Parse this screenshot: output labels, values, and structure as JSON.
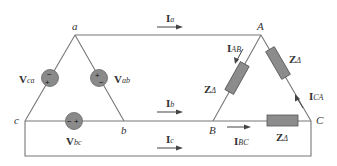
{
  "diagram": {
    "source_nodes": {
      "a": "a",
      "b": "b",
      "c": "c"
    },
    "load_nodes": {
      "A": "A",
      "B": "B",
      "C": "C"
    },
    "sources": [
      {
        "name": "V",
        "sub": "ca",
        "polarity_top": "−",
        "polarity_bottom": "+"
      },
      {
        "name": "V",
        "sub": "ab",
        "polarity_top": "+",
        "polarity_bottom": "−"
      },
      {
        "name": "V",
        "sub": "bc",
        "polarity_left": "−",
        "polarity_right": "+"
      }
    ],
    "line_currents": [
      {
        "name": "I",
        "sub": "a"
      },
      {
        "name": "I",
        "sub": "b"
      },
      {
        "name": "I",
        "sub": "c"
      }
    ],
    "phase_currents": [
      {
        "name": "I",
        "sub": "AB"
      },
      {
        "name": "I",
        "sub": "BC"
      },
      {
        "name": "I",
        "sub": "CA"
      }
    ],
    "impedances": [
      {
        "name": "Z",
        "sub": "Δ"
      },
      {
        "name": "Z",
        "sub": "Δ"
      },
      {
        "name": "Z",
        "sub": "Δ"
      }
    ],
    "colors": {
      "wire": "#777777",
      "component_fill": "#8c8c8c"
    }
  }
}
